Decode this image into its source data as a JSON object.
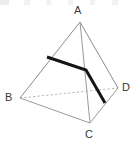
{
  "figure": {
    "shape_type": "tetrahedron",
    "canvas": {
      "width": 137,
      "height": 147,
      "background": "#ffffff"
    },
    "colors": {
      "edge_solid": "#8c8c8c",
      "edge_hidden": "#b5b5b5",
      "highlight": "#151515",
      "label_text": "#3a3a3a"
    },
    "vertices": [
      {
        "id": "A",
        "label": "A",
        "x": 80,
        "y": 22,
        "label_x": 74,
        "label_y": 5
      },
      {
        "id": "B",
        "label": "B",
        "x": 20,
        "y": 98,
        "label_x": 5,
        "label_y": 92
      },
      {
        "id": "C",
        "label": "C",
        "x": 90,
        "y": 123,
        "label_x": 85,
        "label_y": 129
      },
      {
        "id": "D",
        "label": "D",
        "x": 118,
        "y": 88,
        "label_x": 122,
        "label_y": 82
      }
    ],
    "edges": [
      {
        "id": "AB",
        "from": "A",
        "to": "B",
        "style": "solid",
        "width": 1
      },
      {
        "id": "AC",
        "from": "A",
        "to": "C",
        "style": "solid",
        "width": 1
      },
      {
        "id": "AD",
        "from": "A",
        "to": "D",
        "style": "solid",
        "width": 1
      },
      {
        "id": "BC",
        "from": "B",
        "to": "C",
        "style": "solid",
        "width": 1
      },
      {
        "id": "CD",
        "from": "C",
        "to": "D",
        "style": "solid",
        "width": 1
      },
      {
        "id": "BD",
        "from": "B",
        "to": "D",
        "style": "dashed",
        "width": 1
      }
    ],
    "highlight_path": {
      "id": "bold-path",
      "description": "bold polyline across face ABD and down face ACD",
      "points": "47,57 86,70 105,103",
      "width": 3
    }
  }
}
